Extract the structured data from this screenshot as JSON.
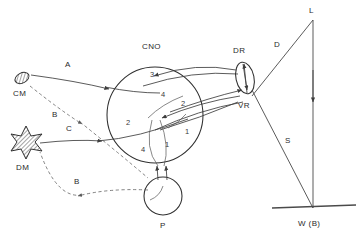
{
  "figure": {
    "background": "#ffffff",
    "ink": "#3d3d3d"
  },
  "nodes": [
    {
      "id": "CM",
      "label": "CM",
      "shape": "hatched-ellipse",
      "x": 22,
      "y": 78,
      "label_x": 20,
      "label_y": 96
    },
    {
      "id": "DM",
      "label": "DM",
      "shape": "hatched-star",
      "x": 26,
      "y": 140,
      "label_x": 23,
      "label_y": 163
    },
    {
      "id": "CNO",
      "label": "CNO",
      "shape": "circle",
      "x": 155,
      "y": 115,
      "label_x": 142,
      "label_y": 49
    },
    {
      "id": "P",
      "label": "P",
      "shape": "circle",
      "x": 163,
      "y": 196,
      "label_x": 160,
      "label_y": 228
    },
    {
      "id": "DR",
      "label": "DR",
      "shape": "ellipse",
      "x": 245,
      "y": 78,
      "label_x": 235,
      "label_y": 53
    },
    {
      "id": "VR",
      "label": "VR",
      "shape": "tract-label",
      "x": 246,
      "y": 105,
      "label_x": 240,
      "label_y": 107
    },
    {
      "id": "L",
      "label": "L",
      "shape": "apex",
      "x": 313,
      "y": 20,
      "label_x": 310,
      "label_y": 13
    },
    {
      "id": "WB",
      "label": "W (B)",
      "shape": "base-point",
      "x": 313,
      "y": 208,
      "label_x": 302,
      "label_y": 226
    }
  ],
  "pathway_labels": [
    {
      "id": "A",
      "label": "A",
      "x": 68,
      "y": 70,
      "style": "solid"
    },
    {
      "id": "B1",
      "label": "B",
      "x": 55,
      "y": 116,
      "style": "dashed"
    },
    {
      "id": "C",
      "label": "C",
      "x": 70,
      "y": 132,
      "style": "solid"
    },
    {
      "id": "B2",
      "label": "B",
      "x": 77,
      "y": 183,
      "style": "dashed"
    },
    {
      "id": "D",
      "label": "D",
      "x": 276,
      "y": 47,
      "style": "solid"
    },
    {
      "id": "S",
      "label": "S",
      "x": 287,
      "y": 141,
      "style": "solid"
    }
  ],
  "cno_numbers": [
    {
      "label": "3",
      "x": 152,
      "y": 76
    },
    {
      "label": "4",
      "x": 163,
      "y": 96
    },
    {
      "label": "2",
      "x": 183,
      "y": 105
    },
    {
      "label": "2",
      "x": 128,
      "y": 124
    },
    {
      "label": "1",
      "x": 186,
      "y": 133
    },
    {
      "label": "4",
      "x": 143,
      "y": 151
    },
    {
      "label": "1",
      "x": 166,
      "y": 146
    }
  ],
  "legend_note": ""
}
